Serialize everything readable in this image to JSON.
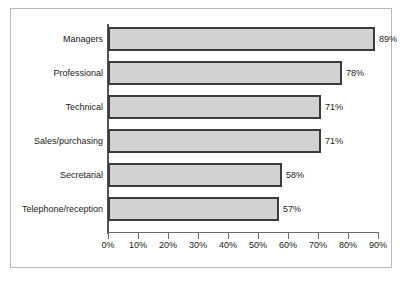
{
  "chart_data": {
    "type": "bar",
    "orientation": "horizontal",
    "title": "",
    "subtitle": "",
    "xlabel": "",
    "ylabel": "",
    "categories": [
      "Managers",
      "Professional",
      "Technical",
      "Sales/purchasing",
      "Secretarial",
      "Telephone/reception"
    ],
    "values": [
      89,
      78,
      71,
      71,
      58,
      57
    ],
    "value_labels": [
      "89%",
      "78%",
      "71%",
      "71%",
      "58%",
      "57%"
    ],
    "xlim": [
      0,
      90
    ],
    "xticks": [
      0,
      10,
      20,
      30,
      40,
      50,
      60,
      70,
      80,
      90
    ],
    "xtick_labels": [
      "0%",
      "10%",
      "20%",
      "30%",
      "40%",
      "50%",
      "60%",
      "70%",
      "80%",
      "90%"
    ],
    "grid": false,
    "legend": null,
    "colors": {
      "bar_fill": "#d2d2d2",
      "bar_border": "#3c3c3c",
      "axis": "#555555",
      "text": "#1a1a1a",
      "frame": "#b9b9b9",
      "background": "#ffffff"
    }
  }
}
